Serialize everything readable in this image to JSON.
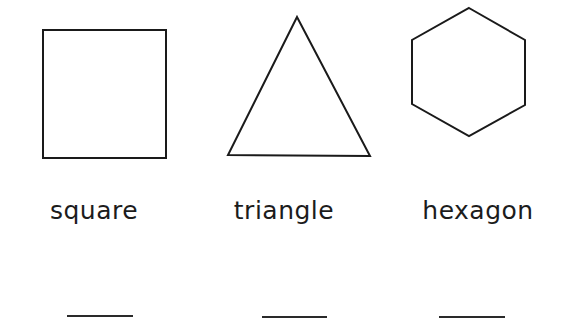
{
  "worksheet": {
    "items": [
      {
        "shape": "square",
        "label": "square",
        "answer": ""
      },
      {
        "shape": "triangle",
        "label": "triangle",
        "answer": ""
      },
      {
        "shape": "hexagon",
        "label": "hexagon",
        "answer": ""
      }
    ],
    "stroke_color": "#1a1a1a",
    "background_color": "#ffffff"
  }
}
